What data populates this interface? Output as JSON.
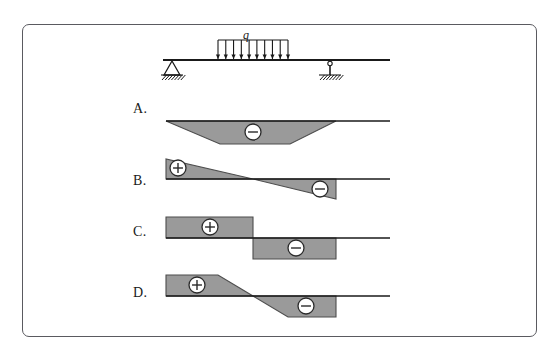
{
  "page": {
    "background_color": "#ffffff",
    "frame": {
      "border_color": "#5a5a60",
      "x": 22,
      "y": 24,
      "width": 515,
      "height": 313,
      "radius": 7
    }
  },
  "colors": {
    "line": "#1a1a1a",
    "fill_gray": "#9a9a9a",
    "fill_gray_stroke": "#4d4d4d",
    "sign_circle_fill": "#ffffff",
    "sign_circle_stroke": "#2a2a2a",
    "text": "#1a1a1a"
  },
  "beam_diagram": {
    "name": "simply-supported-beam-with-partial-uniform-load",
    "load_label": "q",
    "load_label_pos": {
      "x": 243,
      "y": 28
    },
    "beam": {
      "x1": 163,
      "y": 60,
      "x2": 390
    },
    "load": {
      "start_x": 218,
      "end_x": 288,
      "top_y": 40,
      "arrow_count": 10,
      "arrow_tip_y": 59
    },
    "supports": [
      {
        "type": "pin-support",
        "name": "left-pin-support",
        "x": 172,
        "y": 60
      },
      {
        "type": "roller-link-support",
        "name": "right-link-support",
        "x": 330,
        "y": 60
      }
    ]
  },
  "options": [
    {
      "id": "A",
      "label": "A.",
      "label_pos": {
        "x": 133,
        "y": 111
      },
      "baseline": {
        "x1": 166,
        "y": 121,
        "x2": 390
      },
      "shape_type": "trapezoid-below",
      "polygon": "166,121 336,121 290,144 220,144",
      "signs": [
        {
          "symbol": "minus",
          "name": "minus-sign-badge",
          "cx": 253,
          "cy": 132,
          "r": 8
        }
      ]
    },
    {
      "id": "B",
      "label": "B.",
      "label_pos": {
        "x": 133,
        "y": 183
      },
      "baseline": {
        "x1": 166,
        "y": 179,
        "x2": 390
      },
      "shape_type": "two-triangles-crossing",
      "polygons": [
        {
          "name": "positive-triangle",
          "points": "166,159 166,179 253,179"
        },
        {
          "name": "negative-triangle",
          "points": "253,179 336,179 336,199"
        }
      ],
      "signs": [
        {
          "symbol": "plus",
          "name": "plus-sign-badge",
          "cx": 178,
          "cy": 168,
          "r": 8
        },
        {
          "symbol": "minus",
          "name": "minus-sign-badge",
          "cx": 320,
          "cy": 189,
          "r": 8
        }
      ]
    },
    {
      "id": "C",
      "label": "C.",
      "label_pos": {
        "x": 133,
        "y": 234
      },
      "baseline": {
        "x1": 166,
        "y": 238,
        "x2": 390
      },
      "shape_type": "two-rectangles-step",
      "polygons": [
        {
          "name": "positive-rectangle",
          "points": "166,217 253,217 253,238 166,238"
        },
        {
          "name": "negative-rectangle",
          "points": "253,238 336,238 336,259 253,259"
        }
      ],
      "signs": [
        {
          "symbol": "plus",
          "name": "plus-sign-badge",
          "cx": 210,
          "cy": 227,
          "r": 8
        },
        {
          "symbol": "minus",
          "name": "minus-sign-badge",
          "cx": 296,
          "cy": 248,
          "r": 8
        }
      ]
    },
    {
      "id": "D",
      "label": "D.",
      "label_pos": {
        "x": 133,
        "y": 295
      },
      "baseline": {
        "x1": 166,
        "y": 296,
        "x2": 390
      },
      "shape_type": "trapezoid-step-with-slope",
      "polygons": [
        {
          "name": "positive-region",
          "points": "166,275 218,275 253,296 166,296"
        },
        {
          "name": "negative-region",
          "points": "253,296 336,296 336,317 288,317"
        }
      ],
      "signs": [
        {
          "symbol": "plus",
          "name": "plus-sign-badge",
          "cx": 197,
          "cy": 285,
          "r": 8
        },
        {
          "symbol": "minus",
          "name": "minus-sign-badge",
          "cx": 306,
          "cy": 306,
          "r": 8
        }
      ]
    }
  ]
}
